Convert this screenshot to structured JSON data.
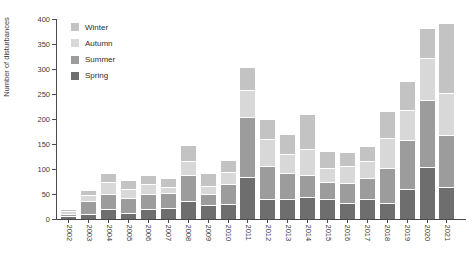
{
  "chart_data": {
    "type": "bar",
    "stacked": true,
    "title": "",
    "xlabel": "",
    "ylabel": "Number of disturbances",
    "ylim": [
      0,
      400
    ],
    "yticks": [
      0,
      50,
      100,
      150,
      200,
      250,
      300,
      350,
      400
    ],
    "grid": false,
    "legend": {
      "position": "top-left-inside",
      "entries_top_to_bottom": [
        "Winter",
        "Autumn",
        "Summer",
        "Spring"
      ]
    },
    "categories": [
      "2002",
      "2003",
      "2004",
      "2005",
      "2006",
      "2007",
      "2008",
      "2009",
      "2010",
      "2011",
      "2012",
      "2013",
      "2014",
      "2015",
      "2016",
      "2017",
      "2018",
      "2019",
      "2020",
      "2021"
    ],
    "stack_order_bottom_to_top": [
      "Spring",
      "Summer",
      "Autumn",
      "Winter"
    ],
    "series": [
      {
        "name": "Spring",
        "color": "#6e6e6e",
        "values": [
          4,
          8,
          18,
          11,
          18,
          20,
          35,
          26,
          28,
          83,
          38,
          39,
          42,
          38,
          31,
          38,
          30,
          58,
          103,
          62
        ]
      },
      {
        "name": "Summer",
        "color": "#9c9c9c",
        "values": [
          5,
          26,
          30,
          30,
          30,
          30,
          52,
          23,
          40,
          119,
          66,
          52,
          44,
          35,
          40,
          43,
          70,
          99,
          133,
          104
        ]
      },
      {
        "name": "Autumn",
        "color": "#d8d8d8",
        "values": [
          5,
          12,
          24,
          17,
          20,
          12,
          27,
          15,
          25,
          54,
          55,
          37,
          53,
          28,
          33,
          34,
          60,
          60,
          84,
          84
        ]
      },
      {
        "name": "Winter",
        "color": "#c3c3c3",
        "values": [
          4,
          11,
          18,
          18,
          18,
          18,
          33,
          27,
          24,
          46,
          39,
          40,
          70,
          34,
          28,
          30,
          55,
          58,
          61,
          140
        ]
      }
    ],
    "totals": [
      18,
      57,
      90,
      76,
      86,
      80,
      147,
      91,
      117,
      302,
      198,
      168,
      209,
      135,
      132,
      145,
      215,
      275,
      381,
      390
    ],
    "colors": {
      "spring": "#6e6e6e",
      "summer": "#9c9c9c",
      "autumn": "#d8d8d8",
      "winter": "#c3c3c3",
      "axis": "#4a4a4a",
      "text": "#3d3d3d",
      "background": "#ffffff"
    }
  }
}
